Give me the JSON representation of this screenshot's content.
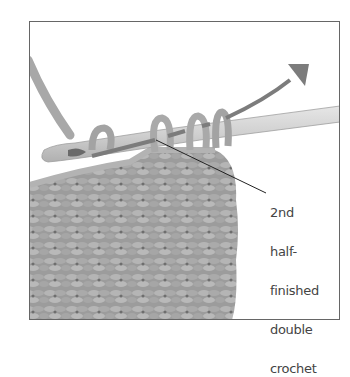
{
  "figure": {
    "callout": {
      "lines": [
        "2nd",
        "half-",
        "finished",
        "double",
        "crochet"
      ]
    },
    "palette": {
      "frame": "#666666",
      "yarn_light": "#b8b8b8",
      "yarn_mid": "#9a9a9a",
      "yarn_dark": "#7a7a7a",
      "hook": "#d4d4d4",
      "arrow": "#7c7c7c",
      "leader_line": "#222222",
      "label_text": "#444444"
    }
  }
}
